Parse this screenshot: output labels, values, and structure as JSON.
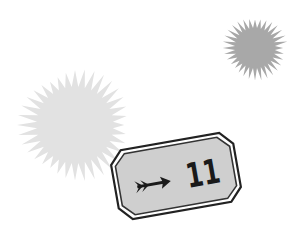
{
  "scene": {
    "background": "#ffffff",
    "starbursts": [
      {
        "name": "large-light-starburst",
        "cx": 75,
        "cy": 125,
        "r_outer": 58,
        "r_inner": 38,
        "points": 36,
        "color": "#e2e2e2"
      },
      {
        "name": "small-dark-starburst",
        "cx": 255,
        "cy": 48,
        "r_outer": 33,
        "r_inner": 20,
        "points": 32,
        "color": "#a8a8a8"
      }
    ],
    "badge": {
      "label": "11",
      "icon": "arrow-right-icon",
      "fill": "#d0d0d0",
      "border": "#222222",
      "rotation_deg": -10
    }
  }
}
